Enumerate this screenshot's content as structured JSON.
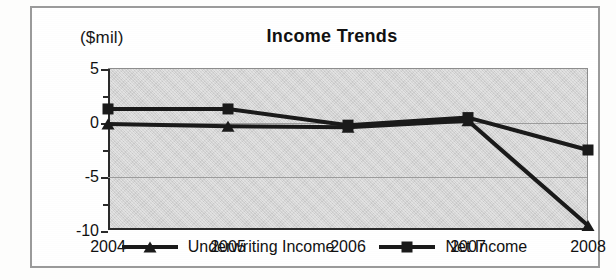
{
  "chart_data": {
    "type": "line",
    "title": "Income Trends",
    "unit_label": "($mil)",
    "xlabel": "",
    "ylabel": "",
    "categories": [
      "2004",
      "2005",
      "2006",
      "2007",
      "2008"
    ],
    "series": [
      {
        "name": "Underwriting Income",
        "marker": "triangle",
        "color": "#1a1a1a",
        "values": [
          -0.1,
          -0.3,
          -0.4,
          0.2,
          -9.5
        ]
      },
      {
        "name": "Net Income",
        "marker": "square",
        "color": "#1a1a1a",
        "values": [
          1.3,
          1.3,
          -0.2,
          0.5,
          -2.5
        ]
      }
    ],
    "ylim": [
      -10,
      5
    ],
    "ytick_labels": [
      "5",
      "0",
      "-5",
      "-10"
    ],
    "ytick_values": [
      5,
      0,
      -5,
      -10
    ],
    "yminor_values": [
      2.5,
      -2.5,
      -7.5
    ],
    "grid": true,
    "legend_position": "bottom",
    "plot_background": "#d4d4d4"
  },
  "legend": {
    "items": [
      {
        "label": "Underwriting Income",
        "marker": "triangle"
      },
      {
        "label": "Net Income",
        "marker": "square"
      }
    ]
  }
}
